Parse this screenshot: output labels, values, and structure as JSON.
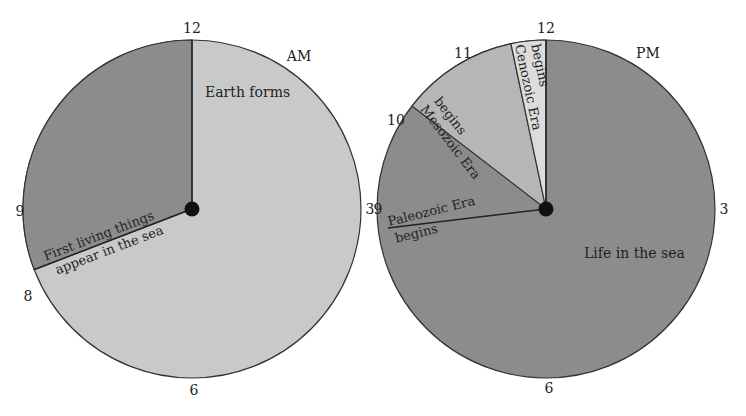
{
  "colors": {
    "dark": "#8a8a8a",
    "light": "#c8c8c8",
    "mid": "#b4b4b4",
    "lightest": "#dcdcdc",
    "stroke": "#333333",
    "hub": "#111111"
  },
  "am_clock": {
    "period": "AM",
    "hours": {
      "h12": "12",
      "h3": "3",
      "h6": "6",
      "h9": "9",
      "h8": "8"
    },
    "segments": [
      {
        "label": "Earth forms",
        "from_hour": 0,
        "to_hour": 8.3
      },
      {
        "label": "First living things appear in the sea",
        "line1": "First living things",
        "line2": "appear in the sea",
        "from_hour": 8.3,
        "to_hour": 12
      }
    ]
  },
  "pm_clock": {
    "period": "PM",
    "hours": {
      "h12": "12",
      "h3": "3",
      "h6": "6",
      "h9": "9",
      "h10": "10",
      "h11": "11"
    },
    "main_label": "Life in the sea",
    "events": [
      {
        "label": "Paleozoic Era begins",
        "line1": "Paleozoic Era",
        "line2": "begins",
        "hour": 8.9
      },
      {
        "label": "Mesozoic Era begins",
        "line1": "Mesozoic Era",
        "line2": "begins",
        "hour": 10.25
      },
      {
        "label": "Cenozoic Era begins",
        "line1": "Cenozoic Era",
        "line2": "begins",
        "hour": 11.6
      }
    ]
  }
}
